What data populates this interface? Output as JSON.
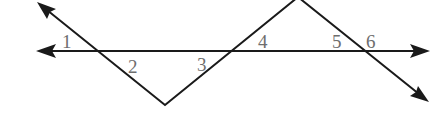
{
  "diagram": {
    "type": "angles-transversal-zigzag",
    "line_color": "#1a1a1a",
    "label_color": "#6e6e6e",
    "horizontal_line": {
      "y": 51,
      "x_start": 38,
      "x_end": 428,
      "arrows": [
        "left",
        "right"
      ]
    },
    "zigzag": {
      "points": [
        [
          38,
          3
        ],
        [
          165,
          105
        ],
        [
          298,
          -3
        ],
        [
          428,
          101
        ]
      ],
      "arrows": [
        "start",
        "end"
      ]
    },
    "intersections": [
      [
        95,
        51
      ],
      [
        230,
        51
      ],
      [
        362,
        51
      ]
    ],
    "angle_labels": [
      {
        "text": "1",
        "x": 62,
        "y": 48
      },
      {
        "text": "2",
        "x": 128,
        "y": 73
      },
      {
        "text": "3",
        "x": 197,
        "y": 71
      },
      {
        "text": "4",
        "x": 258,
        "y": 48
      },
      {
        "text": "5",
        "x": 332,
        "y": 48
      },
      {
        "text": "6",
        "x": 366,
        "y": 48
      }
    ]
  }
}
